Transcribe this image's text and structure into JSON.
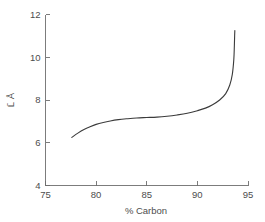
{
  "chart_data": {
    "type": "line",
    "title": "",
    "subtitle": "",
    "xlabel": "% Carbon",
    "ylabel": "L̄ Å",
    "xlim": [
      75,
      95
    ],
    "ylim": [
      4,
      12
    ],
    "xticks": [
      75,
      80,
      85,
      90,
      95
    ],
    "xtick_labels": [
      "75",
      "80",
      "85",
      "90",
      "95"
    ],
    "yticks": [
      4,
      6,
      8,
      10,
      12
    ],
    "ytick_labels": [
      "4",
      "6",
      "8",
      "10",
      "12"
    ],
    "grid": false,
    "legend": null,
    "legend_position": "none",
    "series": [
      {
        "name": "mean crystallite dimension",
        "color": "#3b3b3b",
        "x": [
          77.6,
          78.2,
          78.8,
          79.4,
          80.0,
          80.7,
          81.4,
          82.2,
          83.0,
          84.0,
          85.0,
          86.0,
          87.0,
          88.0,
          89.0,
          90.0,
          90.8,
          91.5,
          92.2,
          92.8,
          93.2,
          93.45,
          93.6,
          93.65,
          93.68,
          93.7
        ],
        "y": [
          6.25,
          6.45,
          6.62,
          6.75,
          6.86,
          6.95,
          7.02,
          7.08,
          7.12,
          7.16,
          7.18,
          7.2,
          7.24,
          7.3,
          7.38,
          7.5,
          7.62,
          7.78,
          8.0,
          8.3,
          8.7,
          9.2,
          9.9,
          10.5,
          11.0,
          11.25
        ]
      }
    ],
    "annotations": []
  },
  "axes": {
    "x_axis_name": "x-axis",
    "y_axis_name": "y-axis"
  }
}
